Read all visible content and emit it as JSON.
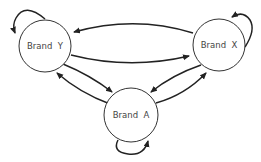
{
  "diagram": {
    "type": "state-transition",
    "nodes": [
      {
        "id": "Y",
        "label": "Brand  Y"
      },
      {
        "id": "X",
        "label": "Brand  X"
      },
      {
        "id": "A",
        "label": "Brand  A"
      }
    ],
    "edges": [
      {
        "from": "Y",
        "to": "Y"
      },
      {
        "from": "X",
        "to": "X"
      },
      {
        "from": "A",
        "to": "A"
      },
      {
        "from": "X",
        "to": "Y"
      },
      {
        "from": "Y",
        "to": "X"
      },
      {
        "from": "Y",
        "to": "A"
      },
      {
        "from": "A",
        "to": "Y"
      },
      {
        "from": "X",
        "to": "A"
      },
      {
        "from": "A",
        "to": "X"
      }
    ],
    "colors": {
      "stroke": "#222222",
      "text": "#444444",
      "background": "#ffffff"
    }
  }
}
